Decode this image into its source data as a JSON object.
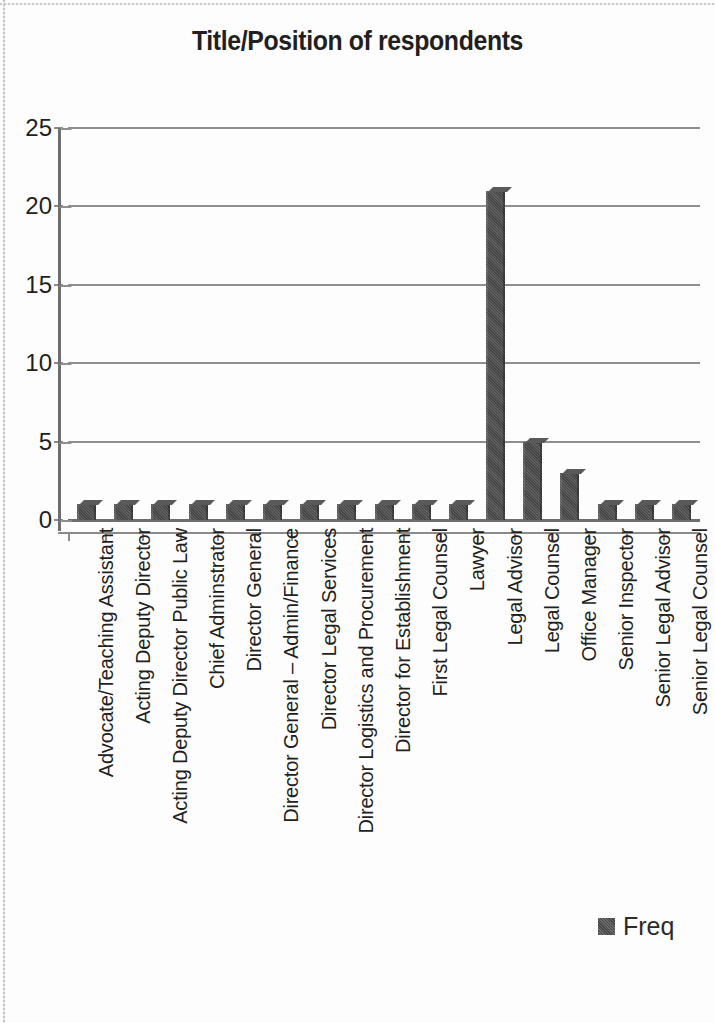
{
  "chart_data": {
    "type": "bar",
    "title": "Title/Position of respondents",
    "xlabel": "",
    "ylabel": "",
    "ylim": [
      0,
      25
    ],
    "yticks": [
      0,
      5,
      10,
      15,
      20,
      25
    ],
    "grid": true,
    "legend_position": "bottom-right",
    "categories": [
      "Advocate/Teaching Assistant",
      "Acting Deputy Director",
      "Acting Deputy Director Public Law",
      "Chief Adminstrator",
      "Director General",
      "Director General – Admin/Finance",
      "Director Legal Services",
      "Director Logistics and Procurement",
      "Director for Establishment",
      "First Legal Counsel",
      "Lawyer",
      "Legal Advisor",
      "Legal Counsel",
      "Office Manager",
      "Senior Inspector",
      "Senior Legal Advisor",
      "Senior Legal Counsel"
    ],
    "series": [
      {
        "name": "Freq",
        "color": "#4d4d4d",
        "values": [
          1,
          1,
          1,
          1,
          1,
          1,
          1,
          1,
          1,
          1,
          1,
          21,
          5,
          3,
          1,
          1,
          1
        ]
      }
    ]
  },
  "legend": {
    "entries": [
      {
        "label": "Freq",
        "color": "#4d4d4d"
      }
    ]
  },
  "colors": {
    "bar": "#4d4d4d",
    "gridline": "#8f8f8f",
    "axis": "#6e6e6e",
    "text": "#231f20",
    "background": "#fdfdfd"
  }
}
